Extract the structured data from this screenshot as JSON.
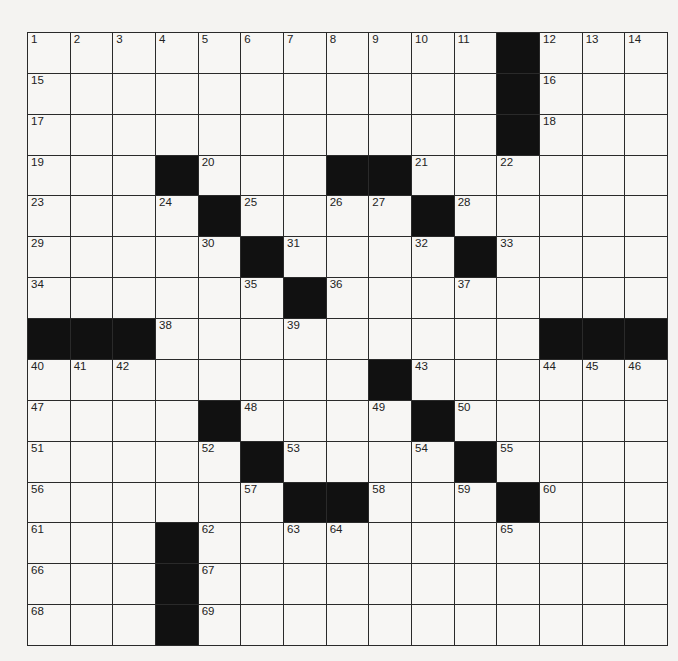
{
  "puzzle": {
    "rows": 15,
    "cols": 15,
    "layout": [
      "...........#...",
      "...........#...",
      "...........#...",
      "...#...##......",
      "....#....#.....",
      ".....#....#....",
      "......#........",
      "###.........###",
      "........#......",
      "....#....#.....",
      ".....#....#....",
      "......##...#...",
      "...#...........",
      "...#...........",
      "...#..........."
    ],
    "numbers": [
      [
        1,
        2,
        3,
        4,
        5,
        6,
        7,
        8,
        9,
        10,
        11,
        0,
        12,
        13,
        14
      ],
      [
        15,
        0,
        0,
        0,
        0,
        0,
        0,
        0,
        0,
        0,
        0,
        0,
        16,
        0,
        0
      ],
      [
        17,
        0,
        0,
        0,
        0,
        0,
        0,
        0,
        0,
        0,
        0,
        0,
        18,
        0,
        0
      ],
      [
        19,
        0,
        0,
        0,
        20,
        0,
        0,
        0,
        0,
        21,
        0,
        22,
        0,
        0,
        0
      ],
      [
        23,
        0,
        0,
        24,
        0,
        25,
        0,
        26,
        27,
        0,
        28,
        0,
        0,
        0,
        0
      ],
      [
        29,
        0,
        0,
        0,
        30,
        0,
        31,
        0,
        0,
        32,
        0,
        33,
        0,
        0,
        0
      ],
      [
        34,
        0,
        0,
        0,
        0,
        35,
        0,
        36,
        0,
        0,
        37,
        0,
        0,
        0,
        0
      ],
      [
        0,
        0,
        0,
        38,
        0,
        0,
        39,
        0,
        0,
        0,
        0,
        0,
        0,
        0,
        0
      ],
      [
        40,
        41,
        42,
        0,
        0,
        0,
        0,
        0,
        0,
        43,
        0,
        0,
        44,
        45,
        46
      ],
      [
        47,
        0,
        0,
        0,
        0,
        48,
        0,
        0,
        49,
        0,
        50,
        0,
        0,
        0,
        0
      ],
      [
        51,
        0,
        0,
        0,
        52,
        0,
        53,
        0,
        0,
        54,
        0,
        55,
        0,
        0,
        0
      ],
      [
        56,
        0,
        0,
        0,
        0,
        57,
        0,
        0,
        58,
        0,
        59,
        0,
        60,
        0,
        0
      ],
      [
        61,
        0,
        0,
        0,
        62,
        0,
        63,
        64,
        0,
        0,
        0,
        65,
        0,
        0,
        0
      ],
      [
        66,
        0,
        0,
        0,
        67,
        0,
        0,
        0,
        0,
        0,
        0,
        0,
        0,
        0,
        0
      ],
      [
        68,
        0,
        0,
        0,
        69,
        0,
        0,
        0,
        0,
        0,
        0,
        0,
        0,
        0,
        0
      ]
    ]
  }
}
